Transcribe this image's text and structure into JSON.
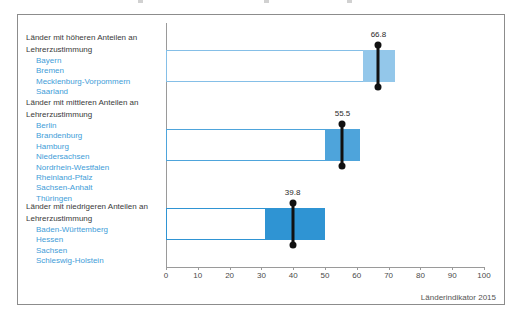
{
  "source_label": "Länderindikator 2015",
  "chart_data": {
    "type": "bar",
    "orientation": "horizontal",
    "title": "",
    "xlabel": "",
    "ylabel": "",
    "xlim": [
      0,
      100
    ],
    "x_ticks": [
      0,
      10,
      20,
      30,
      40,
      50,
      60,
      70,
      80,
      90,
      100
    ],
    "grid": false,
    "legend": "none",
    "marker_style": "black vertical line with end dots = group mean",
    "bar_style": "outlined bar from 0 to group max; filled segment from group min to group max",
    "groups": [
      {
        "label_line1": "Länder mit höheren Anteilen an",
        "label_line2": "Lehrerzustimmung",
        "states": [
          "Bayern",
          "Bremen",
          "Mecklenburg-Vorpommern",
          "Saarland"
        ],
        "mean": 66.8,
        "mean_label": "66.8",
        "range_min": 62,
        "range_max": 72,
        "fill_color": "#93c7ea",
        "border_color": "#85bfe7"
      },
      {
        "label_line1": "Länder mit mittleren Anteilen an",
        "label_line2": "Lehrerzustimmung",
        "states": [
          "Berlin",
          "Brandenburg",
          "Hamburg",
          "Niedersachsen",
          "Nordrhein-Westfalen",
          "Rheinland-Pfalz",
          "Sachsen-Anhalt",
          "Thüringen"
        ],
        "mean": 55.5,
        "mean_label": "55.5",
        "range_min": 50,
        "range_max": 61,
        "fill_color": "#4ea4db",
        "border_color": "#4ea4db"
      },
      {
        "label_line1": "Länder mit niedrigeren Anteilen an",
        "label_line2": "Lehrerzustimmung",
        "states": [
          "Baden-Württemberg",
          "Hessen",
          "Sachsen",
          "Schleswig-Holstein"
        ],
        "mean": 39.8,
        "mean_label": "39.8",
        "range_min": 31,
        "range_max": 50,
        "fill_color": "#2f94d3",
        "border_color": "#2f94d3"
      }
    ],
    "source": "Länderindikator 2015"
  }
}
